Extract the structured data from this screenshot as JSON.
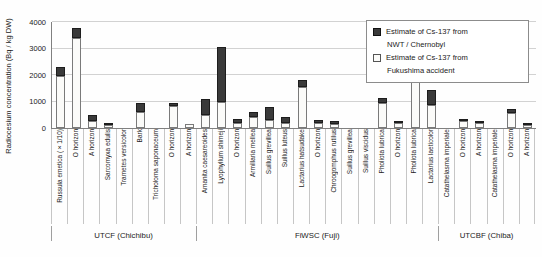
{
  "figure": {
    "y_axis_title": "Radiocesium concentration (Bq / kg DW)"
  },
  "legend": {
    "items": [
      {
        "swatch": "dark",
        "line1": "Estimate of Cs-137 from",
        "line2": "NWT / Chernobyl"
      },
      {
        "swatch": "light",
        "line1": "Estimate of Cs-137 from",
        "line2": "Fukushima accident"
      }
    ]
  },
  "colors": {
    "nwt_chernobyl": "#3a3a3a",
    "fukushima": "#fbfbf9",
    "gridline": "#d2d2d2",
    "axis": "#808080"
  },
  "chart_data": {
    "type": "bar",
    "stacked": true,
    "title": "",
    "xlabel": "",
    "ylabel": "Radiocesium concentration (Bq / kg DW)",
    "ylim": [
      0,
      4000
    ],
    "ytick_step": 1000,
    "grid": true,
    "legend_position": "top-right",
    "categories": [
      "Russula emetica (×1/10)",
      "O horizon",
      "A horizon",
      "Sarcomyxa edulis",
      "Trametes versicolor",
      "Bark",
      "Tricholoma saponaceum",
      "O horizon",
      "A horizon",
      "Amanita caesareoides",
      "Lyophyllum shimeji",
      "O horizon",
      "Armillaria mellea",
      "Suillus grevillea",
      "Suillus luteus",
      "Lactarius hatsudake",
      "O horizon",
      "Chroogomphus rutilus",
      "Suillus grevillea",
      "Suillus viscidus",
      "Pholiota lubrica",
      "O horizon",
      "Pholiota lubrica",
      "Lactarius laeticolor",
      "Catathelasma imperiale",
      "O horizon",
      "A horizon",
      "Catathelasma imperiale",
      "O horizon",
      "A horizon"
    ],
    "series": [
      {
        "name": "Estimate of Cs-137 from Fukushima accident",
        "color_key": "fukushima",
        "values": [
          1950,
          3400,
          250,
          120,
          0,
          600,
          0,
          830,
          150,
          500,
          1000,
          200,
          400,
          300,
          200,
          1550,
          200,
          150,
          0,
          0,
          950,
          180,
          1740,
          850,
          0,
          250,
          180,
          0,
          550,
          100
        ]
      },
      {
        "name": "Estimate of Cs-137 from NWT / Chernobyl",
        "color_key": "nwt_chernobyl",
        "values": [
          370,
          390,
          250,
          50,
          0,
          350,
          0,
          100,
          0,
          600,
          2050,
          150,
          200,
          480,
          200,
          280,
          100,
          100,
          0,
          0,
          170,
          100,
          170,
          570,
          0,
          100,
          60,
          0,
          150,
          50
        ]
      }
    ],
    "groups": [
      {
        "label": "UTCF (Chichibu)",
        "start": 0,
        "count": 9
      },
      {
        "label": "FiWSC (Fuji)",
        "start": 9,
        "count": 15
      },
      {
        "label": "UTCBF (Chiba)",
        "start": 24,
        "count": 6
      }
    ]
  }
}
